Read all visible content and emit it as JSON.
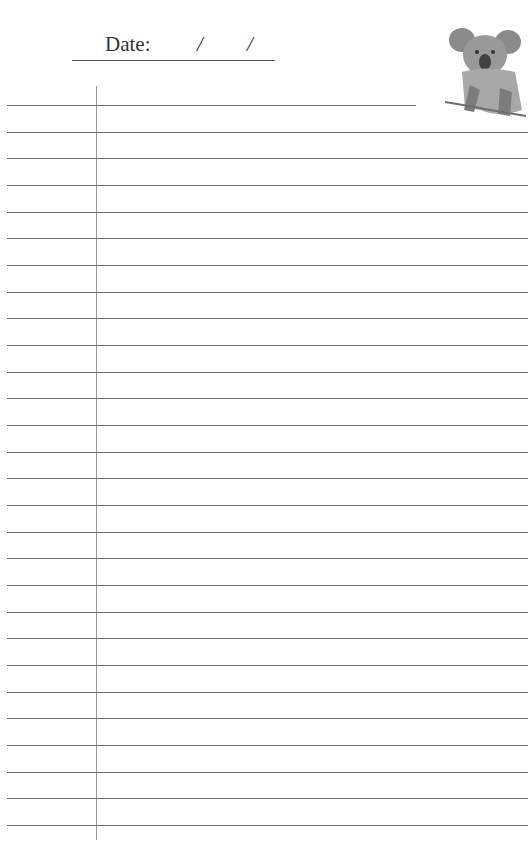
{
  "header": {
    "date_label": "Date:",
    "date_separator_1": "/",
    "date_separator_2": "/"
  },
  "page": {
    "line_count": 28,
    "first_line_y": 105,
    "line_spacing": 26.67,
    "margin_x": 96,
    "line_color": "#6a6a6a",
    "margin_color": "#9a9a9a"
  },
  "illustration": {
    "name": "koala-illustration",
    "style": "pencil-sketch"
  }
}
